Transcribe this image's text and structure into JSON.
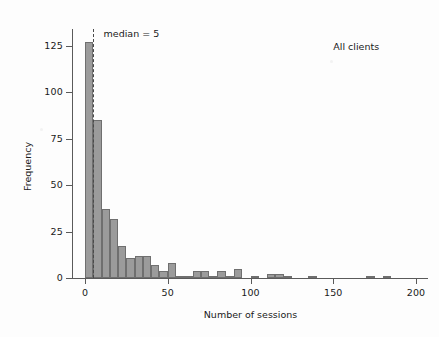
{
  "chart_data": {
    "type": "bar",
    "title": "",
    "subtitle": "",
    "xlabel": "Number of sessions",
    "ylabel": "Frequency",
    "xlim": [
      -8,
      210
    ],
    "ylim": [
      0,
      134
    ],
    "xticks": [
      0,
      50,
      100,
      150,
      200
    ],
    "xticklabels": [
      "0",
      "50",
      "100",
      "150",
      "200"
    ],
    "yticks": [
      0,
      25,
      50,
      75,
      100,
      125
    ],
    "yticklabels": [
      "0",
      "25",
      "50",
      "75",
      "100",
      "125"
    ],
    "grid": false,
    "legend": "none",
    "bin_width": 5,
    "bar_color": "#9b9b9b",
    "bar_edge_color": "#6f6f6f",
    "annotations": [
      {
        "name": "median-label",
        "text": "median = 5",
        "x": 10,
        "y": 131
      },
      {
        "name": "panel-label",
        "text": "All clients",
        "x": 150,
        "y": 124
      }
    ],
    "median_line": {
      "value": 5,
      "style": "dashed",
      "color": "#4a4a4a"
    },
    "bins": [
      {
        "x0": 0,
        "x1": 5,
        "value": 127
      },
      {
        "x0": 5,
        "x1": 10,
        "value": 85
      },
      {
        "x0": 10,
        "x1": 15,
        "value": 37
      },
      {
        "x0": 15,
        "x1": 20,
        "value": 32
      },
      {
        "x0": 20,
        "x1": 25,
        "value": 17
      },
      {
        "x0": 25,
        "x1": 30,
        "value": 11
      },
      {
        "x0": 30,
        "x1": 35,
        "value": 12
      },
      {
        "x0": 35,
        "x1": 40,
        "value": 12
      },
      {
        "x0": 40,
        "x1": 45,
        "value": 7
      },
      {
        "x0": 45,
        "x1": 50,
        "value": 4
      },
      {
        "x0": 50,
        "x1": 55,
        "value": 8
      },
      {
        "x0": 55,
        "x1": 60,
        "value": 1
      },
      {
        "x0": 60,
        "x1": 65,
        "value": 1
      },
      {
        "x0": 65,
        "x1": 70,
        "value": 4
      },
      {
        "x0": 70,
        "x1": 75,
        "value": 4
      },
      {
        "x0": 75,
        "x1": 80,
        "value": 1
      },
      {
        "x0": 80,
        "x1": 85,
        "value": 4
      },
      {
        "x0": 85,
        "x1": 90,
        "value": 1
      },
      {
        "x0": 90,
        "x1": 95,
        "value": 5
      },
      {
        "x0": 95,
        "x1": 100,
        "value": 0
      },
      {
        "x0": 100,
        "x1": 105,
        "value": 1
      },
      {
        "x0": 105,
        "x1": 110,
        "value": 0
      },
      {
        "x0": 110,
        "x1": 115,
        "value": 2
      },
      {
        "x0": 115,
        "x1": 120,
        "value": 2
      },
      {
        "x0": 120,
        "x1": 125,
        "value": 1
      },
      {
        "x0": 125,
        "x1": 130,
        "value": 0
      },
      {
        "x0": 130,
        "x1": 135,
        "value": 0
      },
      {
        "x0": 135,
        "x1": 140,
        "value": 1
      },
      {
        "x0": 140,
        "x1": 145,
        "value": 0
      },
      {
        "x0": 145,
        "x1": 150,
        "value": 0
      },
      {
        "x0": 150,
        "x1": 155,
        "value": 0
      },
      {
        "x0": 155,
        "x1": 160,
        "value": 0
      },
      {
        "x0": 160,
        "x1": 165,
        "value": 0
      },
      {
        "x0": 165,
        "x1": 170,
        "value": 0
      },
      {
        "x0": 170,
        "x1": 175,
        "value": 1
      },
      {
        "x0": 175,
        "x1": 180,
        "value": 0
      },
      {
        "x0": 180,
        "x1": 185,
        "value": 1
      },
      {
        "x0": 185,
        "x1": 190,
        "value": 0
      },
      {
        "x0": 190,
        "x1": 195,
        "value": 0
      },
      {
        "x0": 195,
        "x1": 200,
        "value": 0
      }
    ]
  },
  "figure": {
    "background": "#fdfdfd",
    "axis_color": "#5a5a5a",
    "text_color": "#1a1a1a"
  }
}
